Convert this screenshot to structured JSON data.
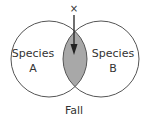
{
  "diagram": {
    "type": "venn",
    "sets": [
      {
        "id": "A",
        "label_line1": "Species",
        "label_line2": "A"
      },
      {
        "id": "B",
        "label_line1": "Species",
        "label_line2": "B"
      }
    ],
    "marker": "×",
    "caption": "Fall",
    "colors": {
      "stroke": "#555555",
      "overlap_fill": "#a8a8a8",
      "text": "#333333"
    }
  }
}
